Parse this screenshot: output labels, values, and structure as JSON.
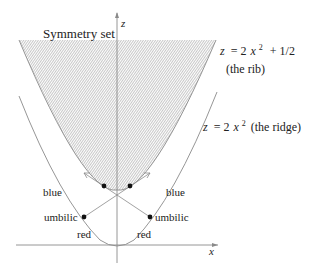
{
  "figure": {
    "title_label": "Symmetry set",
    "axes": {
      "x_label": "x",
      "z_label": "z"
    },
    "curves": {
      "rib": {
        "equation_lhs": "z",
        "equation_rhs_main": "= 2",
        "equation_var": "x",
        "equation_exp": "2",
        "equation_tail": "+ 1/2",
        "caption": "(the rib)"
      },
      "ridge": {
        "equation_lhs": "z",
        "equation_rhs_main": "= 2",
        "equation_var": "x",
        "equation_exp": "2",
        "equation_tail": "(the ridge)"
      }
    },
    "labels": {
      "blue_left": "blue",
      "blue_right": "blue",
      "umbilic_left": "umbilic",
      "umbilic_right": "umbilic",
      "red_left": "red",
      "red_right": "red"
    },
    "colors": {
      "line": "#8a8a8a",
      "hatch": "#bdbdbd",
      "dot": "#111111",
      "text": "#222222"
    }
  }
}
